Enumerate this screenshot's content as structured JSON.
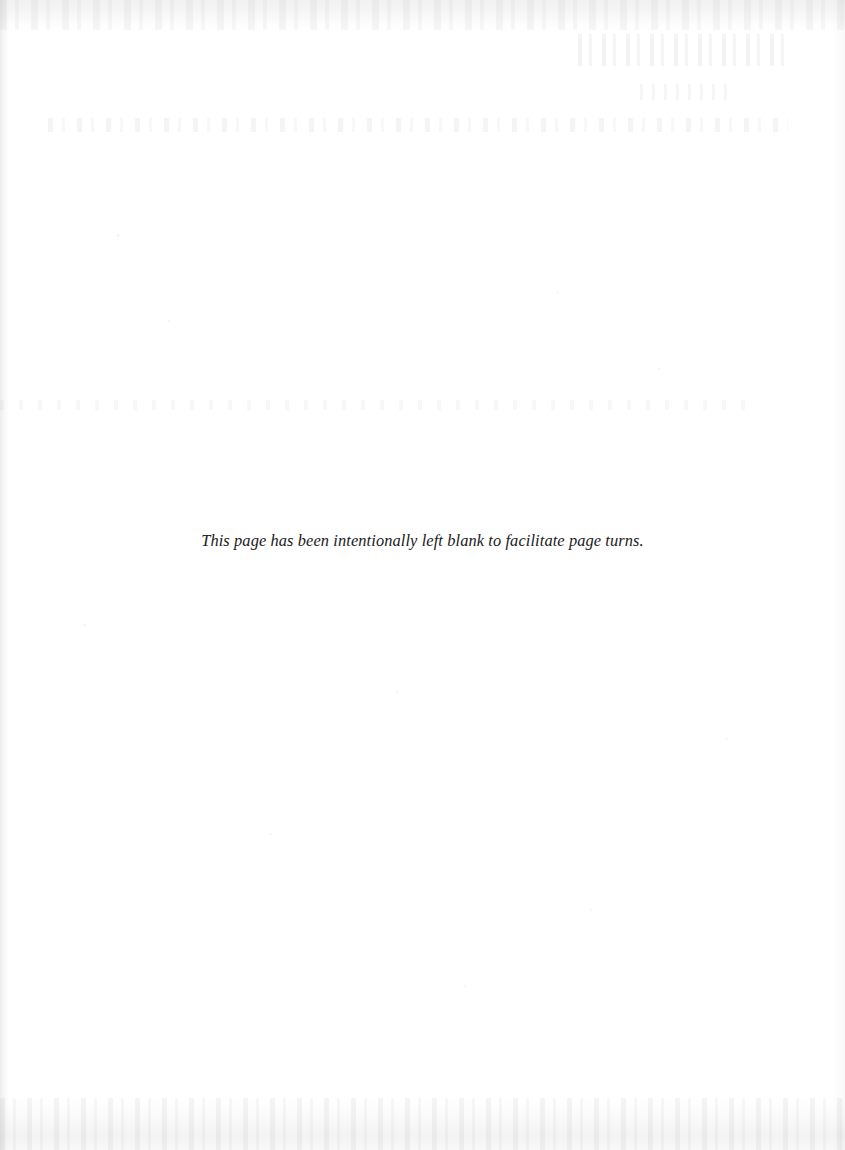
{
  "page": {
    "kind": "scanned-book-page",
    "background_color": "#ffffff",
    "width": 845,
    "height": 1150,
    "notice_text": "This page has been intentionally left blank to facilitate page turns.",
    "notice_color": "#1a1a1a"
  },
  "artifacts": {
    "top_smudge_band": "",
    "ghost_text_upper_right": "",
    "ghost_text_upper_right_secondary": "",
    "ghost_text_line_upper": "",
    "ghost_text_line_middle": "",
    "speck_field": "",
    "bottom_smudge_band": "",
    "left_scan_edge": "",
    "right_scan_edge": ""
  }
}
